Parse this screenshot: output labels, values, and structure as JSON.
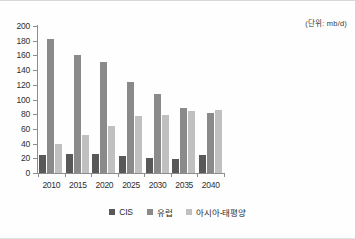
{
  "unit_note": "(단위: mb/d)",
  "chart_data": {
    "type": "bar",
    "title": "",
    "subtitle": "",
    "xlabel": "",
    "ylabel": "",
    "unit_note": "(단위: mb/d)",
    "categories": [
      "2010",
      "2015",
      "2020",
      "2025",
      "2030",
      "2035",
      "2040"
    ],
    "series": [
      {
        "name": "CIS",
        "color": "#585858",
        "values": [
          25,
          26,
          26,
          23,
          21,
          19,
          25
        ]
      },
      {
        "name": "유럽",
        "color": "#8a8a8a",
        "values": [
          183,
          160,
          151,
          124,
          108,
          89,
          82
        ]
      },
      {
        "name": "아시아-태평양",
        "color": "#c0c0c0",
        "values": [
          40,
          52,
          64,
          78,
          79,
          84,
          86
        ]
      }
    ],
    "ylim": [
      0,
      200
    ],
    "ytick_step": 20,
    "yticks": [
      200,
      180,
      160,
      140,
      120,
      100,
      80,
      60,
      40,
      20,
      0
    ],
    "grid": false,
    "legend_position": "bottom"
  }
}
